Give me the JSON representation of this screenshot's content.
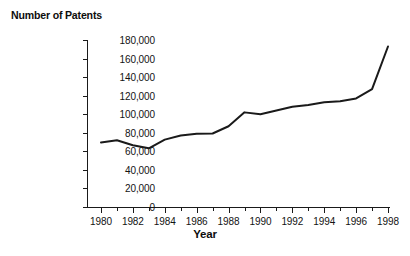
{
  "chart_data": {
    "type": "line",
    "title": "Number of Patents",
    "xlabel": "Year",
    "ylabel": "Number of Patents",
    "x": [
      1980,
      1981,
      1982,
      1983,
      1984,
      1985,
      1986,
      1987,
      1988,
      1989,
      1990,
      1991,
      1992,
      1993,
      1994,
      1995,
      1996,
      1997,
      1998
    ],
    "values": [
      69600,
      72000,
      66500,
      63300,
      72600,
      77000,
      79000,
      79200,
      87000,
      102000,
      100000,
      104000,
      108000,
      110000,
      113000,
      114000,
      117000,
      127000,
      173000
    ],
    "series": [
      {
        "name": "Number of Patents",
        "values": [
          69600,
          72000,
          66500,
          63300,
          72600,
          77000,
          79000,
          79200,
          87000,
          102000,
          100000,
          104000,
          108000,
          110000,
          113000,
          114000,
          117000,
          127000,
          173000
        ]
      }
    ],
    "xlim": [
      1980,
      1998
    ],
    "ylim": [
      0,
      180000
    ],
    "y_ticks": [
      0,
      20000,
      40000,
      60000,
      80000,
      100000,
      120000,
      140000,
      160000,
      180000
    ],
    "y_tick_labels": [
      "0",
      "20,000",
      "40,000",
      "60,000",
      "80,000",
      "100,000",
      "120,000",
      "140,000",
      "160,000",
      "180,000"
    ],
    "x_ticks": [
      1980,
      1982,
      1984,
      1986,
      1988,
      1990,
      1992,
      1994,
      1996,
      1998
    ],
    "x_tick_labels": [
      "1980",
      "1982",
      "1984",
      "1986",
      "1988",
      "1990",
      "1992",
      "1994",
      "1996",
      "1998"
    ],
    "x_minor_ticks": [
      1981,
      1983,
      1985,
      1987,
      1989,
      1991,
      1993,
      1995,
      1997
    ],
    "grid": false,
    "legend": false,
    "line_color": "#1a1a1a",
    "line_width": 2,
    "background_color": "#ffffff",
    "axis_color": "#1a1a1a"
  }
}
